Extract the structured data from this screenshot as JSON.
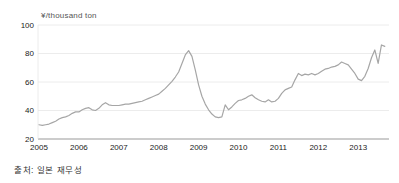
{
  "chart": {
    "unit_label": "¥/thousand ton",
    "source_note": "출처: 일본 재무성",
    "colors": {
      "line": "#a6a6a6",
      "grid": "#e7e7e7",
      "axis": "#999999",
      "tick_text": "#222222",
      "unit_text": "#555555"
    }
  },
  "chart_data": {
    "type": "line",
    "title": "¥/thousand ton",
    "subtitle": "",
    "xlabel": "",
    "ylabel": "¥/thousand ton",
    "source": "출처: 일본 재무성",
    "x_unit": "month",
    "x_start_year": 2005,
    "x_tick_years": [
      2005,
      2006,
      2007,
      2008,
      2009,
      2010,
      2011,
      2012,
      2013
    ],
    "y_ticks": [
      20,
      40,
      60,
      80,
      100
    ],
    "ylim": [
      20,
      100
    ],
    "grid": true,
    "legend": "none",
    "values": [
      30,
      29.5,
      30,
      30.5,
      31.5,
      32.5,
      34,
      35,
      35.5,
      36.5,
      38,
      39,
      39,
      40.5,
      41.5,
      42,
      40.5,
      40,
      41.5,
      44,
      45.5,
      44,
      43.5,
      43.5,
      43.5,
      44,
      44.5,
      44.5,
      45,
      45.5,
      46,
      46.5,
      47.5,
      48.5,
      49.5,
      50.5,
      51.5,
      53.5,
      55.5,
      58,
      60.5,
      63.5,
      67,
      73,
      79,
      82,
      78,
      68.5,
      58,
      50,
      44.5,
      40.5,
      37.5,
      35.5,
      35,
      35.5,
      44,
      40.5,
      42.5,
      45,
      47,
      47.5,
      48.5,
      50,
      51,
      49,
      47.5,
      46.5,
      46,
      47.5,
      46,
      46.5,
      48.5,
      52,
      54.5,
      55.5,
      56.5,
      61.5,
      66,
      64.5,
      65.5,
      65,
      66,
      65,
      66,
      67.5,
      69,
      69.5,
      70.5,
      71,
      72,
      74,
      73,
      72,
      69,
      66,
      62,
      61,
      64,
      69.5,
      77,
      82.5,
      73,
      86,
      85
    ]
  }
}
